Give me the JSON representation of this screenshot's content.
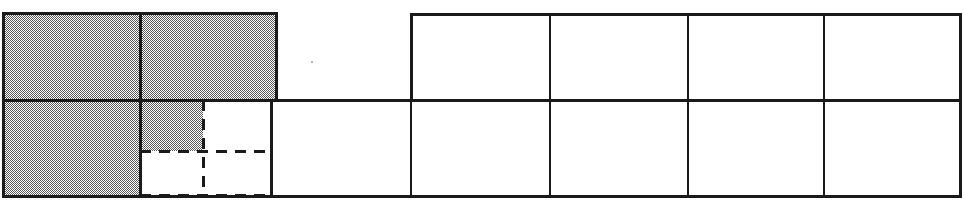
{
  "figure": {
    "title": "Area model: shaded and unshaded rectangle grid",
    "canvas": {
      "width": 964,
      "height": 204
    },
    "colors": {
      "shaded_fill": "#808080",
      "unshaded_fill": "#ffffff",
      "stroke": "#1a1a1a",
      "background": "#ffffff"
    },
    "stroke_widths": {
      "solid_outer": 3.0,
      "solid_inner": 2.6,
      "dashed": 3.0
    },
    "dash_pattern": "11 8",
    "geometry": {
      "left_block": {
        "x0": 3,
        "y0": 13,
        "x1": 276,
        "y1": 196,
        "mid_x": 140,
        "mid_y": 100
      },
      "right_grid": {
        "top_row": {
          "y0": 14,
          "y1": 100,
          "x_edges": [
            411,
            550,
            688,
            824,
            960
          ]
        },
        "bottom_row": {
          "y0": 100,
          "y1": 196,
          "x_edges": [
            271,
            411,
            550,
            688,
            824,
            960
          ]
        }
      },
      "dashed_lines": {
        "vertical_x": 203,
        "vertical_y0": 100,
        "vertical_y1": 196,
        "horizontal_upper_y": 151,
        "horizontal_upper_x0": 140,
        "horizontal_upper_x1": 271,
        "horizontal_lower_y": 195,
        "horizontal_lower_x0": 140,
        "horizontal_lower_x1": 271
      }
    },
    "cells": [
      {
        "name": "left-top-left",
        "x": 3,
        "y": 13,
        "w": 137,
        "h": 87,
        "shaded": true
      },
      {
        "name": "left-top-right",
        "x": 140,
        "y": 13,
        "w": 136,
        "h": 87,
        "shaded": true
      },
      {
        "name": "left-bottom-left",
        "x": 3,
        "y": 100,
        "w": 137,
        "h": 96,
        "shaded": true
      },
      {
        "name": "left-bottom-inner",
        "x": 140,
        "y": 100,
        "w": 63,
        "h": 51,
        "shaded": true
      },
      {
        "name": "left-bottom-open",
        "x": 203,
        "y": 100,
        "w": 68,
        "h": 51,
        "shaded": false
      },
      {
        "name": "left-bottom-void",
        "x": 140,
        "y": 151,
        "w": 131,
        "h": 44,
        "shaded": false
      },
      {
        "name": "grid-top-1",
        "x": 411,
        "y": 14,
        "w": 139,
        "h": 86,
        "shaded": false
      },
      {
        "name": "grid-top-2",
        "x": 550,
        "y": 14,
        "w": 138,
        "h": 86,
        "shaded": false
      },
      {
        "name": "grid-top-3",
        "x": 688,
        "y": 14,
        "w": 136,
        "h": 86,
        "shaded": false
      },
      {
        "name": "grid-top-4",
        "x": 824,
        "y": 14,
        "w": 136,
        "h": 86,
        "shaded": false
      },
      {
        "name": "grid-bottom-0",
        "x": 271,
        "y": 100,
        "w": 140,
        "h": 96,
        "shaded": false
      },
      {
        "name": "grid-bottom-1",
        "x": 411,
        "y": 100,
        "w": 139,
        "h": 96,
        "shaded": false
      },
      {
        "name": "grid-bottom-2",
        "x": 550,
        "y": 100,
        "w": 138,
        "h": 96,
        "shaded": false
      },
      {
        "name": "grid-bottom-3",
        "x": 688,
        "y": 100,
        "w": 136,
        "h": 96,
        "shaded": false
      },
      {
        "name": "grid-bottom-4",
        "x": 824,
        "y": 100,
        "w": 136,
        "h": 96,
        "shaded": false
      }
    ],
    "counts": {
      "shaded_full_units": 3,
      "total_full_units": 9,
      "partial_units": 1
    },
    "artifacts": [
      {
        "name": "speck",
        "x": 312,
        "y": 62,
        "r": 1.2
      }
    ],
    "labels": []
  }
}
